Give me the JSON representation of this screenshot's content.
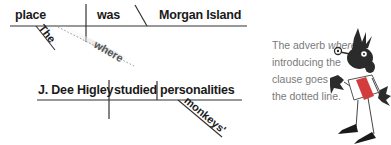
{
  "diagram": {
    "top_line": {
      "subject": "place",
      "verb": "was",
      "complement": "Morgan Island",
      "modifiers": {
        "the": "The",
        "where": "where"
      }
    },
    "bottom_line": {
      "subject": "J. Dee Higley",
      "verb": "studied",
      "object": "personalities",
      "modifiers": {
        "monkeys": "monkeys'"
      }
    }
  },
  "caption": {
    "prefix": "The adverb ",
    "emphasis": "where",
    "suffix": " introducing the clause goes on the dotted line."
  },
  "mascot": {
    "icon": "cartoon-character-icon"
  },
  "colors": {
    "line": "#333333",
    "text": "#1a1a1a",
    "caption": "#7a7a7a",
    "mascot_dark": "#2b2b2b",
    "mascot_red": "#d23c3c"
  }
}
